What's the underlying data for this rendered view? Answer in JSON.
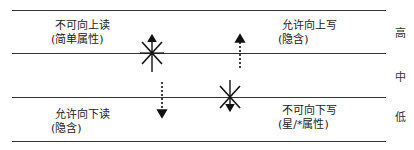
{
  "levels": {
    "high": "高",
    "mid": "中",
    "low": "低"
  },
  "labels": {
    "no_read_up": {
      "line1": "不可向上读",
      "line2": "(简单属性)"
    },
    "allow_write_up": {
      "line1": "允许向上写",
      "line2": "(隐含)"
    },
    "allow_read_down": {
      "line1": "允许向下读",
      "line2": "(隐含)"
    },
    "no_write_down": {
      "line1": "不可向下写",
      "line2": "(星/*属性)"
    }
  },
  "arrows": [
    {
      "name": "read-up",
      "style": "solid",
      "direction": "up",
      "blocked": true
    },
    {
      "name": "write-up",
      "style": "dotted",
      "direction": "up",
      "blocked": false
    },
    {
      "name": "read-down",
      "style": "dotted",
      "direction": "down",
      "blocked": false
    },
    {
      "name": "write-down",
      "style": "solid",
      "direction": "down",
      "blocked": true
    }
  ]
}
